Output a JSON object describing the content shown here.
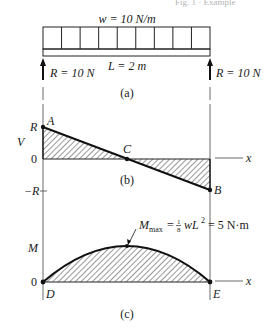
{
  "header": {
    "partial_text": "Fig. 1 · Example"
  },
  "beam": {
    "load_label": "w = 10 N/m",
    "length_label": "L = 2 m",
    "left_reaction": "R = 10 N",
    "right_reaction": "R = 10 N",
    "caption": "(a)",
    "load_cells": 9
  },
  "shear": {
    "axis_label": "V",
    "tick_top": "R",
    "tick_zero": "0",
    "tick_bottom": "−R",
    "point_a": "A",
    "point_b": "B",
    "point_c": "C",
    "x_label": "x",
    "caption": "(b)"
  },
  "moment": {
    "axis_label": "M",
    "tick_zero": "0",
    "point_d": "D",
    "point_e": "E",
    "x_label": "x",
    "max_label_prefix": "M",
    "max_label_sub": "max",
    "max_label_eq": "= ",
    "max_label_frac_num": "1",
    "max_label_frac_den": "8",
    "max_label_rest": "wL",
    "max_label_exp": "2",
    "max_label_value": "= 5 N·m",
    "caption": "(c)"
  },
  "chart_data": [
    {
      "type": "line",
      "title": "Shear diagram (b)",
      "xlabel": "x",
      "ylabel": "V",
      "x": [
        0,
        1,
        2
      ],
      "values": [
        10,
        0,
        -10
      ],
      "points": {
        "A": [
          0,
          10
        ],
        "C": [
          1,
          0
        ],
        "B": [
          2,
          -10
        ]
      },
      "ytick_labels": [
        "R",
        "0",
        "-R"
      ]
    },
    {
      "type": "area",
      "title": "Moment diagram (c)",
      "xlabel": "x",
      "ylabel": "M",
      "x": [
        0,
        0.5,
        1,
        1.5,
        2
      ],
      "values": [
        0,
        3.75,
        5,
        3.75,
        0
      ],
      "points": {
        "D": [
          0,
          0
        ],
        "E": [
          2,
          0
        ]
      },
      "annotation": "M_max = 1/8 wL^2 = 5 N·m"
    }
  ]
}
